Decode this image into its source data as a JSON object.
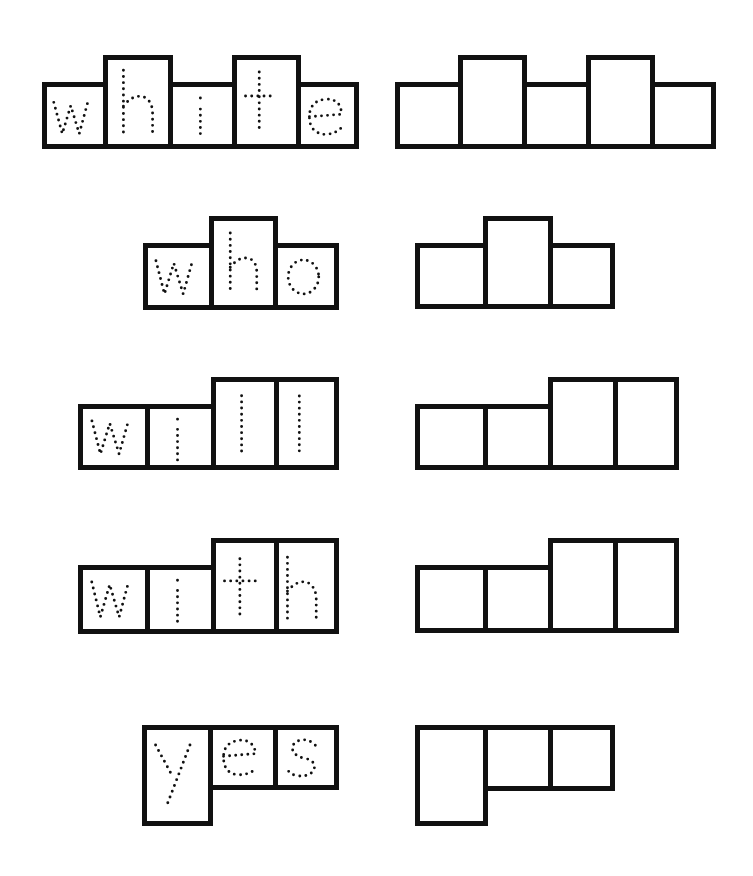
{
  "worksheet": {
    "type": "sight-word letter box tracing",
    "words": [
      {
        "word": "white",
        "letters": [
          "w",
          "h",
          "i",
          "t",
          "e"
        ],
        "heights": [
          "short",
          "tall",
          "short",
          "tall",
          "short"
        ]
      },
      {
        "word": "who",
        "letters": [
          "w",
          "h",
          "o"
        ],
        "heights": [
          "short",
          "tall",
          "short"
        ]
      },
      {
        "word": "will",
        "letters": [
          "w",
          "i",
          "l",
          "l"
        ],
        "heights": [
          "short",
          "short",
          "tall",
          "tall"
        ]
      },
      {
        "word": "with",
        "letters": [
          "w",
          "i",
          "t",
          "h"
        ],
        "heights": [
          "short",
          "short",
          "tall",
          "tall"
        ]
      },
      {
        "word": "yes",
        "letters": [
          "y",
          "e",
          "s"
        ],
        "heights": [
          "descender",
          "short",
          "short"
        ]
      }
    ],
    "colors": {
      "ink": "#111111",
      "paper": "#ffffff"
    }
  }
}
